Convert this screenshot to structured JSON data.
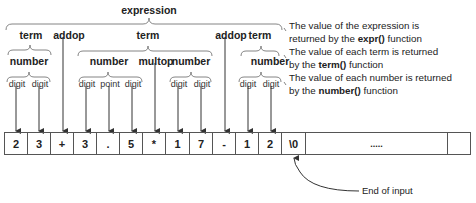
{
  "title": "expression",
  "level1": [
    {
      "label": "term",
      "x": 31
    },
    {
      "label": "addop",
      "x": 69
    },
    {
      "label": "term",
      "x": 148
    },
    {
      "label": "addop",
      "x": 231
    },
    {
      "label": "term",
      "x": 260
    }
  ],
  "level2": [
    {
      "label": "number",
      "x": 29
    },
    {
      "label": "number",
      "x": 109
    },
    {
      "label": "multop",
      "x": 156
    },
    {
      "label": "number",
      "x": 191
    },
    {
      "label": "number",
      "x": 270
    }
  ],
  "level3": [
    {
      "label": "digit",
      "x": 17
    },
    {
      "label": "digit",
      "x": 40
    },
    {
      "label": "digit",
      "x": 87
    },
    {
      "label": "point",
      "x": 110
    },
    {
      "label": "digit",
      "x": 133
    },
    {
      "label": "digit",
      "x": 179
    },
    {
      "label": "digit",
      "x": 202
    },
    {
      "label": "digit",
      "x": 248
    },
    {
      "label": "digit",
      "x": 271
    }
  ],
  "input_cells": [
    "2",
    "3",
    "+",
    "3",
    ".",
    "5",
    "*",
    "1",
    "7",
    "-",
    "1",
    "2",
    "\\0",
    "....."
  ],
  "notes": [
    {
      "line1": "The value of the expression is",
      "line2_pre": "returned by the ",
      "fn": "expr()",
      "line2_post": " function"
    },
    {
      "line1": "The value of each term is returned",
      "line2_pre": "by the ",
      "fn": "term()",
      "line2_post": " function"
    },
    {
      "line1": "The value of each number is returned",
      "line2_pre": "by the ",
      "fn": "number()",
      "line2_post": " function"
    }
  ],
  "end_label": "End of input"
}
